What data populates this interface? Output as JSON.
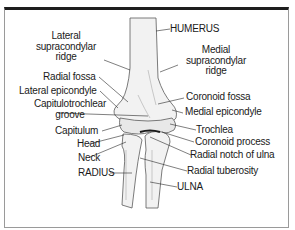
{
  "diagram": {
    "labels": {
      "humerus": "HUMERUS",
      "lateral_supracondylar_ridge": [
        "Lateral",
        "supracondylar",
        "ridge"
      ],
      "medial_supracondylar_ridge": [
        "Medial",
        "supracondylar",
        "ridge"
      ],
      "radial_fossa": "Radial fossa",
      "coronoid_fossa": "Coronoid fossa",
      "lateral_epicondyle": "Lateral epicondyle",
      "medial_epicondyle": "Medial epicondyle",
      "capitulotrochlear_groove": [
        "Capitulotrochlear",
        "groove"
      ],
      "capitulum": "Capitulum",
      "trochlea": "Trochlea",
      "head": "Head",
      "coronoid_process": "Coronoid process",
      "neck": "Neck",
      "radial_notch_of_ulna": "Radial notch of ulna",
      "radius": "RADIUS",
      "radial_tuberosity": "Radial tuberosity",
      "ulna": "ULNA"
    },
    "colors": {
      "frame_top": "#1e1e1e",
      "frame_side": "#9a9a9a",
      "bone_fill": "#f1f1f1",
      "bone_stroke": "#555555",
      "text": "#1a1a1a"
    }
  }
}
